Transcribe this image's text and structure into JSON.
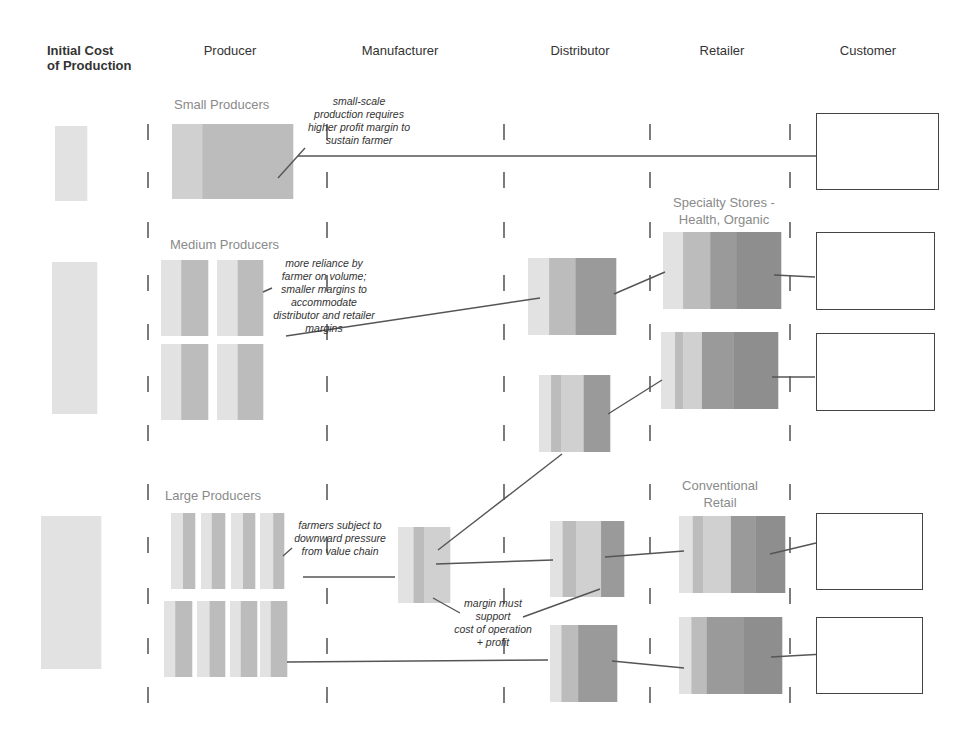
{
  "columns": [
    {
      "id": "initial",
      "label": "Initial Cost of Production",
      "line1": "Initial Cost",
      "line2": "of Production",
      "x": 47
    },
    {
      "id": "producer",
      "label": "Producer",
      "x": 230
    },
    {
      "id": "manufacturer",
      "label": "Manufacturer",
      "x": 400
    },
    {
      "id": "distributor",
      "label": "Distributor",
      "x": 580
    },
    {
      "id": "retailer",
      "label": "Retailer",
      "x": 722
    },
    {
      "id": "customer",
      "label": "Customer",
      "x": 868
    }
  ],
  "dividers_x": [
    148,
    327,
    504,
    650,
    790
  ],
  "dividers_y": [
    132,
    180,
    230,
    283,
    332,
    384,
    433,
    492,
    545,
    596,
    646,
    695
  ],
  "groups": {
    "small": {
      "label": "Small Producers"
    },
    "medium": {
      "label": "Medium Producers"
    },
    "large": {
      "label": "Large Producers"
    }
  },
  "channel_labels": {
    "specialty": {
      "line1": "Specialty Stores -",
      "line2": "Health, Organic"
    },
    "conventional": {
      "line1": "Conventional",
      "line2": "Retail"
    }
  },
  "notes": {
    "small": [
      "small-scale",
      "production requires",
      "higher profit margin to",
      "sustain farmer"
    ],
    "medium": [
      "more reliance by",
      "farmer on volume;",
      "smaller margins to",
      "accommodate",
      "distributor and retailer",
      "margins"
    ],
    "large": [
      "farmers subject to",
      "downward pressure",
      "from value chain"
    ],
    "manufacturer": [
      "margin must",
      "support",
      "cost of operation",
      "+ profit"
    ]
  },
  "colors": {
    "light": "#e2e2e2",
    "mid_light": "#d0d0d0",
    "mid": "#bcbcbc",
    "dark": "#9a9a9a",
    "darker": "#8e8e8e",
    "line": "#555555",
    "divider": "#444444",
    "header_text": "#333333",
    "label_text": "#8a8a8a"
  },
  "blocks": [
    {
      "id": "init-small",
      "x": 55,
      "y": 126,
      "w": 32,
      "h": 75,
      "bands": [
        [
          "light",
          1
        ]
      ]
    },
    {
      "id": "init-medium",
      "x": 52,
      "y": 262,
      "w": 45,
      "h": 152,
      "bands": [
        [
          "light",
          1
        ]
      ]
    },
    {
      "id": "init-large",
      "x": 41,
      "y": 516,
      "w": 60,
      "h": 153,
      "bands": [
        [
          "light",
          1
        ]
      ]
    },
    {
      "id": "prod-small",
      "x": 172,
      "y": 124,
      "w": 121,
      "h": 75,
      "bands": [
        [
          "mid_light",
          0.25
        ],
        [
          "mid",
          0.75
        ]
      ]
    },
    {
      "id": "prod-med-1",
      "x": 161,
      "y": 260,
      "w": 47,
      "h": 76,
      "bands": [
        [
          "light",
          0.43
        ],
        [
          "mid",
          0.57
        ]
      ]
    },
    {
      "id": "prod-med-2",
      "x": 217,
      "y": 260,
      "w": 46,
      "h": 76,
      "bands": [
        [
          "light",
          0.45
        ],
        [
          "mid",
          0.55
        ]
      ]
    },
    {
      "id": "prod-med-3",
      "x": 161,
      "y": 344,
      "w": 47,
      "h": 76,
      "bands": [
        [
          "light",
          0.43
        ],
        [
          "mid",
          0.57
        ]
      ]
    },
    {
      "id": "prod-med-4",
      "x": 217,
      "y": 344,
      "w": 46,
      "h": 76,
      "bands": [
        [
          "light",
          0.45
        ],
        [
          "mid",
          0.55
        ]
      ]
    },
    {
      "id": "prod-lg-1",
      "x": 171,
      "y": 513,
      "w": 24,
      "h": 76,
      "bands": [
        [
          "light",
          0.5
        ],
        [
          "mid",
          0.5
        ]
      ]
    },
    {
      "id": "prod-lg-2",
      "x": 201,
      "y": 513,
      "w": 24,
      "h": 76,
      "bands": [
        [
          "light",
          0.45
        ],
        [
          "mid",
          0.55
        ]
      ]
    },
    {
      "id": "prod-lg-3",
      "x": 231,
      "y": 513,
      "w": 24,
      "h": 76,
      "bands": [
        [
          "light",
          0.5
        ],
        [
          "mid",
          0.5
        ]
      ]
    },
    {
      "id": "prod-lg-4",
      "x": 260,
      "y": 513,
      "w": 24,
      "h": 76,
      "bands": [
        [
          "light",
          0.55
        ],
        [
          "mid",
          0.45
        ]
      ]
    },
    {
      "id": "prod-lg-5",
      "x": 164,
      "y": 601,
      "w": 28,
      "h": 76,
      "bands": [
        [
          "light",
          0.4
        ],
        [
          "mid",
          0.6
        ]
      ]
    },
    {
      "id": "prod-lg-6",
      "x": 197,
      "y": 601,
      "w": 28,
      "h": 76,
      "bands": [
        [
          "light",
          0.45
        ],
        [
          "mid",
          0.55
        ]
      ]
    },
    {
      "id": "prod-lg-7",
      "x": 230,
      "y": 601,
      "w": 27,
      "h": 76,
      "bands": [
        [
          "light",
          0.4
        ],
        [
          "mid",
          0.6
        ]
      ]
    },
    {
      "id": "prod-lg-8",
      "x": 260,
      "y": 601,
      "w": 27,
      "h": 76,
      "bands": [
        [
          "light",
          0.4
        ],
        [
          "mid",
          0.6
        ]
      ]
    },
    {
      "id": "manu-large",
      "x": 398,
      "y": 527,
      "w": 52,
      "h": 76,
      "bands": [
        [
          "light",
          0.3
        ],
        [
          "mid",
          0.2
        ],
        [
          "mid_light",
          0.5
        ]
      ]
    },
    {
      "id": "dist-medium-a",
      "x": 528,
      "y": 258,
      "w": 88,
      "h": 77,
      "bands": [
        [
          "light",
          0.24
        ],
        [
          "mid",
          0.3
        ],
        [
          "dark",
          0.46
        ]
      ]
    },
    {
      "id": "dist-medium-b",
      "x": 539,
      "y": 375,
      "w": 71,
      "h": 77,
      "bands": [
        [
          "light",
          0.17
        ],
        [
          "mid",
          0.14
        ],
        [
          "mid_light",
          0.32
        ],
        [
          "dark",
          0.37
        ]
      ]
    },
    {
      "id": "dist-large-a",
      "x": 550,
      "y": 521,
      "w": 74,
      "h": 76,
      "bands": [
        [
          "light",
          0.17
        ],
        [
          "mid",
          0.18
        ],
        [
          "mid_light",
          0.34
        ],
        [
          "dark",
          0.31
        ]
      ]
    },
    {
      "id": "dist-large-b",
      "x": 550,
      "y": 625,
      "w": 67,
      "h": 77,
      "bands": [
        [
          "light",
          0.17
        ],
        [
          "mid",
          0.25
        ],
        [
          "dark",
          0.58
        ]
      ]
    },
    {
      "id": "ret-spec-a",
      "x": 663,
      "y": 232,
      "w": 118,
      "h": 77,
      "bands": [
        [
          "light",
          0.17
        ],
        [
          "mid",
          0.23
        ],
        [
          "dark",
          0.22
        ],
        [
          "darker",
          0.38
        ]
      ]
    },
    {
      "id": "ret-spec-b",
      "x": 661,
      "y": 332,
      "w": 117,
      "h": 77,
      "bands": [
        [
          "light",
          0.12
        ],
        [
          "mid",
          0.07
        ],
        [
          "mid_light",
          0.16
        ],
        [
          "dark",
          0.27
        ],
        [
          "darker",
          0.38
        ]
      ]
    },
    {
      "id": "ret-conv-a",
      "x": 679,
      "y": 516,
      "w": 106,
      "h": 77,
      "bands": [
        [
          "light",
          0.13
        ],
        [
          "mid",
          0.1
        ],
        [
          "mid_light",
          0.26
        ],
        [
          "dark",
          0.23
        ],
        [
          "darker",
          0.28
        ]
      ]
    },
    {
      "id": "ret-conv-b",
      "x": 679,
      "y": 617,
      "w": 103,
      "h": 77,
      "bands": [
        [
          "light",
          0.12
        ],
        [
          "mid",
          0.15
        ],
        [
          "dark",
          0.36
        ],
        [
          "darker",
          0.37
        ]
      ]
    }
  ],
  "customers": [
    {
      "id": "cust-small",
      "x": 816,
      "y": 113,
      "w": 123,
      "h": 77
    },
    {
      "id": "cust-spec-a",
      "x": 816,
      "y": 232,
      "w": 119,
      "h": 78
    },
    {
      "id": "cust-spec-b",
      "x": 816,
      "y": 333,
      "w": 119,
      "h": 78
    },
    {
      "id": "cust-conv-a",
      "x": 816,
      "y": 513,
      "w": 107,
      "h": 77
    },
    {
      "id": "cust-conv-b",
      "x": 816,
      "y": 617,
      "w": 107,
      "h": 77
    }
  ],
  "connectors": [
    {
      "id": "small-note-pointer",
      "x1": 278,
      "y1": 178,
      "x2": 305,
      "y2": 148
    },
    {
      "id": "small-to-customer",
      "x1": 298,
      "y1": 156,
      "x2": 816,
      "y2": 156
    },
    {
      "id": "medium-note-pointer",
      "x1": 263,
      "y1": 292,
      "x2": 272,
      "y2": 288
    },
    {
      "id": "medium-to-dist",
      "x1": 286,
      "y1": 336,
      "x2": 540,
      "y2": 298
    },
    {
      "id": "dist-a-to-spec-a",
      "x1": 614,
      "y1": 294,
      "x2": 665,
      "y2": 272
    },
    {
      "id": "spec-a-to-customer",
      "x1": 774,
      "y1": 275,
      "x2": 815,
      "y2": 277
    },
    {
      "id": "dist-b-to-spec-b",
      "x1": 608,
      "y1": 414,
      "x2": 662,
      "y2": 380
    },
    {
      "id": "spec-b-to-customer",
      "x1": 772,
      "y1": 377,
      "x2": 815,
      "y2": 377
    },
    {
      "id": "dist-b-to-manu",
      "x1": 562,
      "y1": 454,
      "x2": 438,
      "y2": 550
    },
    {
      "id": "large-note-pointer",
      "x1": 283,
      "y1": 556,
      "x2": 292,
      "y2": 548
    },
    {
      "id": "large-to-manu",
      "x1": 303,
      "y1": 577,
      "x2": 395,
      "y2": 577
    },
    {
      "id": "manu-to-dist-large-a",
      "x1": 436,
      "y1": 564,
      "x2": 553,
      "y2": 560
    },
    {
      "id": "manu-note-pointer",
      "x1": 433,
      "y1": 598,
      "x2": 460,
      "y2": 613
    },
    {
      "id": "dist-large-a-note-pointer",
      "x1": 600,
      "y1": 589,
      "x2": 523,
      "y2": 617
    },
    {
      "id": "dist-large-a-to-conv-a",
      "x1": 605,
      "y1": 557,
      "x2": 684,
      "y2": 551
    },
    {
      "id": "conv-a-to-customer",
      "x1": 770,
      "y1": 554,
      "x2": 816,
      "y2": 543
    },
    {
      "id": "large-to-dist-large-b",
      "x1": 287,
      "y1": 662,
      "x2": 548,
      "y2": 660
    },
    {
      "id": "dist-large-b-to-conv-b",
      "x1": 612,
      "y1": 661,
      "x2": 684,
      "y2": 668
    },
    {
      "id": "conv-b-to-customer",
      "x1": 771,
      "y1": 657,
      "x2": 842,
      "y2": 653
    }
  ]
}
